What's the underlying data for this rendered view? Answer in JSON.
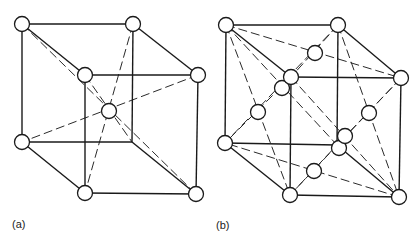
{
  "figure": {
    "panels": [
      {
        "id": "a",
        "label": "(a)",
        "structure": "body-centered cubic",
        "corners": {
          "back_tl": [
            22,
            24
          ],
          "back_tr": [
            133,
            24
          ],
          "back_br": [
            132,
            142
          ],
          "back_bl": [
            22,
            142
          ],
          "front_tl": [
            85,
            75
          ],
          "front_tr": [
            198,
            75
          ],
          "front_br": [
            196,
            194
          ],
          "front_bl": [
            85,
            193
          ]
        },
        "visible_corner_atoms": [
          "back_tl",
          "back_tr",
          "back_bl",
          "front_tl",
          "front_tr",
          "front_br",
          "front_bl"
        ],
        "center_atom": [
          109,
          111
        ],
        "dashed_body_diagonals": [
          [
            "back_tl",
            "front_br"
          ],
          [
            "back_tr",
            "front_bl"
          ],
          [
            "front_tl",
            "back_br"
          ],
          [
            "front_tr",
            "back_bl"
          ]
        ]
      },
      {
        "id": "b",
        "label": "(b)",
        "structure": "face-centered cubic",
        "corners": {
          "back_tl": [
            226,
            25
          ],
          "back_tr": [
            338,
            25
          ],
          "back_br": [
            337,
            145
          ],
          "back_bl": [
            225,
            143
          ],
          "front_tl": [
            291,
            77
          ],
          "front_tr": [
            401,
            78
          ],
          "front_br": [
            399,
            197
          ],
          "front_bl": [
            290,
            195
          ]
        },
        "visible_corner_atoms": [
          "back_tl",
          "back_tr",
          "back_bl",
          "front_tl",
          "front_tr",
          "front_br",
          "front_bl"
        ],
        "face_center_atoms": {
          "top": [
            315,
            53
          ],
          "left": [
            258,
            112
          ],
          "right": [
            369,
            113
          ],
          "bottom": [
            314,
            171
          ],
          "back": [
            282,
            88
          ],
          "front": [
            345,
            136
          ]
        },
        "extra_atom": [
          339,
          148
        ]
      }
    ],
    "atom_radius": 7.5,
    "colors": {
      "line": "#1a1a1a",
      "atom_fill": "#ffffff",
      "background": "#ffffff"
    }
  }
}
